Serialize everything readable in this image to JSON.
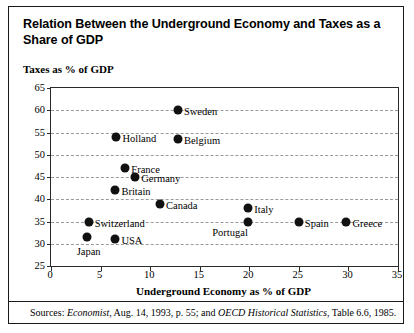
{
  "figure": {
    "title": "Relation Between the Underground Economy and Taxes as a Share of GDP",
    "source_prefix": "Sources:",
    "source_italic_1": "Economist",
    "source_mid": ", Aug. 14, 1993, p. 55; and ",
    "source_italic_2": "OECD Historical Statistics",
    "source_suffix": ", Table 6.6, 1985."
  },
  "chart_data": {
    "type": "scatter",
    "title": "Relation Between the Underground Economy and Taxes as a Share of GDP",
    "xlabel": "Underground Economy as % of GDP",
    "ylabel": "Taxes as % of GDP",
    "xlim": [
      0,
      35
    ],
    "ylim": [
      25,
      65
    ],
    "xticks": [
      0,
      5,
      10,
      15,
      20,
      25,
      30,
      35
    ],
    "yticks": [
      25,
      30,
      35,
      40,
      45,
      50,
      55,
      60,
      65
    ],
    "grid": "horizontal-dashed",
    "legend": "none",
    "marker_color": "#111111",
    "points": [
      {
        "label": "Sweden",
        "x": 12.8,
        "y": 60.0,
        "label_side": "right"
      },
      {
        "label": "Holland",
        "x": 6.6,
        "y": 54.0,
        "label_side": "right"
      },
      {
        "label": "Belgium",
        "x": 12.8,
        "y": 53.5,
        "label_side": "right"
      },
      {
        "label": "France",
        "x": 7.5,
        "y": 47.0,
        "label_side": "right"
      },
      {
        "label": "Germany",
        "x": 8.5,
        "y": 45.0,
        "label_side": "right"
      },
      {
        "label": "Britain",
        "x": 6.5,
        "y": 42.0,
        "label_side": "right"
      },
      {
        "label": "Canada",
        "x": 11.0,
        "y": 39.0,
        "label_side": "right"
      },
      {
        "label": "Italy",
        "x": 19.9,
        "y": 38.0,
        "label_side": "right"
      },
      {
        "label": "Switzerland",
        "x": 3.8,
        "y": 35.0,
        "label_side": "right"
      },
      {
        "label": "Portugal",
        "x": 19.9,
        "y": 35.0,
        "label_side": "below-left"
      },
      {
        "label": "Spain",
        "x": 25.0,
        "y": 35.0,
        "label_side": "right"
      },
      {
        "label": "Greece",
        "x": 29.8,
        "y": 35.0,
        "label_side": "right"
      },
      {
        "label": "USA",
        "x": 6.5,
        "y": 31.0,
        "label_side": "right"
      },
      {
        "label": "Japan",
        "x": 3.6,
        "y": 31.5,
        "label_side": "below"
      }
    ]
  }
}
